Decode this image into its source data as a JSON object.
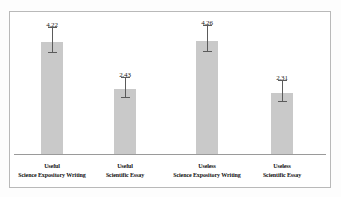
{
  "chart_data": {
    "type": "bar",
    "title": "",
    "subtitle": "",
    "xlabel": "",
    "ylabel": "",
    "ylim": [
      0,
      5.2
    ],
    "grid": false,
    "legend": null,
    "legend_position": "none",
    "bar_color": "#c9c9c9",
    "errorbar_color": "#5b5b5b",
    "frame_color": "#b9b9b9",
    "axis_color": "#9a9a9a",
    "tick_labels_y": [],
    "tick_labels_x": [
      "Useful\nScience Expository Writing",
      "Useful\nScientific Essay",
      "Useless\nScience Expository Writing",
      "Useless\nScientific Essay"
    ],
    "categories": [
      "Useful Science Expository Writing",
      "Useful Scientific Essay",
      "Useless Science Expository Writing",
      "Useless Scientific Essay"
    ],
    "values": [
      4.22,
      2.43,
      4.26,
      2.31
    ],
    "value_labels": [
      "4.22",
      "2.43",
      "4.26",
      "2.31"
    ],
    "errors": [
      0.55,
      0.45,
      0.58,
      0.46
    ],
    "bars": [
      {
        "category_line1": "Useful",
        "category_line2": "Science Expository Writing",
        "value": 4.22,
        "value_label": "4.22",
        "error": 0.55
      },
      {
        "category_line1": "Useful",
        "category_line2": "Scientific Essay",
        "value": 2.43,
        "value_label": "2.43",
        "error": 0.45
      },
      {
        "category_line1": "Useless",
        "category_line2": "Science Expository Writing",
        "value": 4.26,
        "value_label": "4.26",
        "error": 0.58
      },
      {
        "category_line1": "Useless",
        "category_line2": "Scientific Essay",
        "value": 2.31,
        "value_label": "2.31",
        "error": 0.46
      }
    ]
  }
}
